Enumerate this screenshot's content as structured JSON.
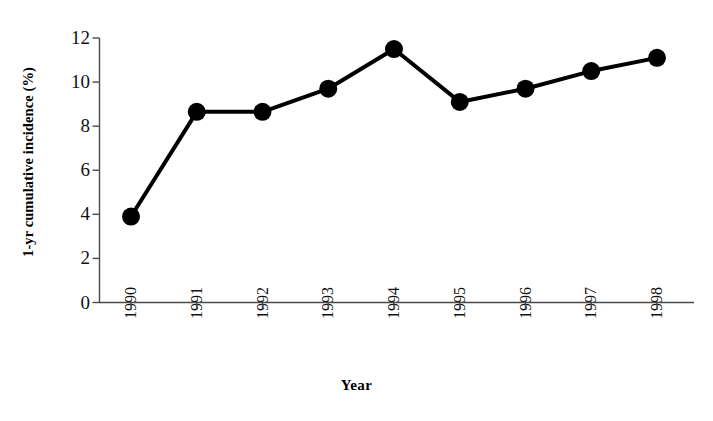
{
  "chart_data": {
    "type": "line",
    "title": "",
    "subtitle": "",
    "xlabel": "Year",
    "ylabel": "1-yr cumulative incidence (%)",
    "categories": [
      "1990",
      "1991",
      "1992",
      "1993",
      "1994",
      "1995",
      "1996",
      "1997",
      "1998"
    ],
    "x": [
      1990,
      1991,
      1992,
      1993,
      1994,
      1995,
      1996,
      1997,
      1998
    ],
    "values": [
      3.9,
      8.65,
      8.65,
      9.7,
      11.5,
      9.1,
      9.7,
      10.5,
      11.1
    ],
    "series": [
      {
        "name": "1-yr cumulative incidence (%)",
        "values": [
          3.9,
          8.65,
          8.65,
          9.7,
          11.5,
          9.1,
          9.7,
          10.5,
          11.1
        ],
        "color": "#000000",
        "marker": "filled-circle"
      }
    ],
    "ylim": [
      0,
      12
    ],
    "yticks": [
      0,
      2,
      4,
      6,
      8,
      10,
      12
    ],
    "ytick_labels": [
      "0",
      "2",
      "4",
      "6",
      "8",
      "10",
      "12"
    ],
    "xtick_labels": [
      "1990",
      "1991",
      "1992",
      "1993",
      "1994",
      "1995",
      "1996",
      "1997",
      "1998"
    ],
    "xtick_rotation": 90,
    "grid": false,
    "legend": null,
    "legend_position": "none",
    "annotations": [],
    "line_color": "#000000",
    "line_width": 4,
    "marker_size": 9,
    "background_color": "#ffffff"
  },
  "axes": {
    "y_title": "1-yr cumulative incidence (%)",
    "x_title": "Year"
  }
}
